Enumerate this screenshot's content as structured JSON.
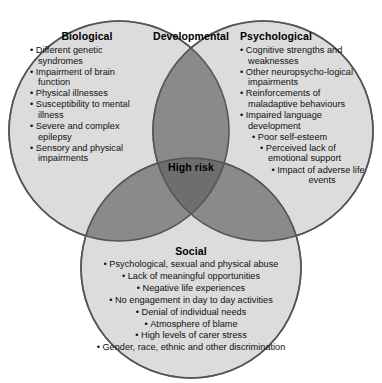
{
  "diagram": {
    "type": "venn-3-circle",
    "title_center": "High risk",
    "colors": {
      "circle_fill": "#dcdcdc",
      "pair_overlap": "#8a8a8a",
      "triple_overlap": "#6e6e6e",
      "stroke": "#555555",
      "text": "#111111",
      "background": "#ffffff"
    }
  },
  "biological": {
    "title": "Biological",
    "items": [
      "Different genetic syndromes",
      "Impairment of brain function",
      "Physical illnesses",
      "Susceptibility to mental illness",
      "Severe and complex epilepsy",
      "Sensory and physical impairments"
    ]
  },
  "developmental": {
    "title": "Developmental"
  },
  "psychological": {
    "title": "Psychological",
    "items": [
      "Cognitive strengths and weaknesses",
      "Other neuropsycho-logical impairments",
      "Reinforcements of maladaptive behaviours",
      "Impaired language development",
      "Poor self-esteem",
      "Perceived lack of emotional support",
      "Impact of adverse life events"
    ]
  },
  "social": {
    "title": "Social",
    "items": [
      "Psychological, sexual and physical abuse",
      "Lack of meaningful opportunities",
      "Negative life experiences",
      "No engagement in day to day activities",
      "Denial of individual needs",
      "Atmosphere of blame",
      "High levels of carer stress",
      "Gender, race, ethnic and other discrimination"
    ]
  },
  "center": {
    "label": "High risk"
  }
}
